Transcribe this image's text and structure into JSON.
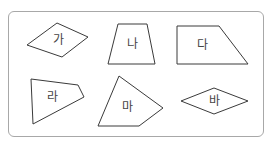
{
  "figure": {
    "frame_color": "#a8a8a8",
    "stroke_color": "#3a3a3a",
    "shapes": [
      {
        "label": "가",
        "type": "rhombus-like quadrilateral",
        "points": "57,23 88,37 62,57 27,45",
        "label_pos": [
          58,
          40
        ]
      },
      {
        "label": "나",
        "type": "trapezoid",
        "points": "118,24 147,24 155,64 108,64",
        "label_pos": [
          132,
          44
        ]
      },
      {
        "label": "다",
        "type": "right trapezoid",
        "points": "177,26 219,26 248,64 177,64",
        "label_pos": [
          202,
          45
        ]
      },
      {
        "label": "라",
        "type": "quadrilateral",
        "points": "31,79 78,85 84,97 33,124",
        "label_pos": [
          52,
          97
        ]
      },
      {
        "label": "마",
        "type": "quadrilateral",
        "points": "119,76 163,108 139,126 98,126",
        "label_pos": [
          127,
          107
        ]
      },
      {
        "label": "바",
        "type": "rhombus",
        "points": "181,101 214,88 248,101 214,114",
        "label_pos": [
          214,
          101
        ]
      }
    ]
  }
}
